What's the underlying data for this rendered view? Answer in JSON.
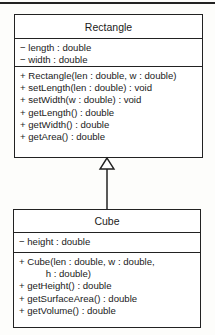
{
  "diagram": {
    "type": "UML class diagram",
    "relationship": "generalization (Cube inherits from Rectangle)",
    "classes": [
      {
        "name": "Rectangle",
        "attributes": [
          "− length : double",
          "− width : double"
        ],
        "methods": [
          "+ Rectangle(len : double, w : double)",
          "+ setLength(len : double) : void",
          "+ setWidth(w : double) : void",
          "+ getLength() : double",
          "+ getWidth() : double",
          "+ getArea() : double"
        ]
      },
      {
        "name": "Cube",
        "attributes": [
          "− height : double"
        ],
        "methods": [
          "+ Cube(len : double, w : double,",
          "          h : double)",
          "+ getHeight() : double",
          "+ getSurfaceArea() : double",
          "+ getVolume() : double"
        ]
      }
    ],
    "colors": {
      "line": "#222222",
      "background": "#fdfdfb"
    }
  }
}
